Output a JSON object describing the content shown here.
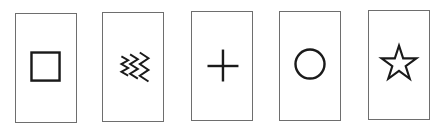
{
  "cards": [
    {
      "symbol": "square-icon",
      "x": 15,
      "y": 13
    },
    {
      "symbol": "wavy-lines-icon",
      "x": 102,
      "y": 12
    },
    {
      "symbol": "plus-icon",
      "x": 191,
      "y": 11
    },
    {
      "symbol": "circle-icon",
      "x": 279,
      "y": 11
    },
    {
      "symbol": "star-icon",
      "x": 368,
      "y": 10
    }
  ],
  "colors": {
    "border": "#6e6e6e",
    "symbol": "#1a1a1a",
    "background": "#ffffff"
  }
}
